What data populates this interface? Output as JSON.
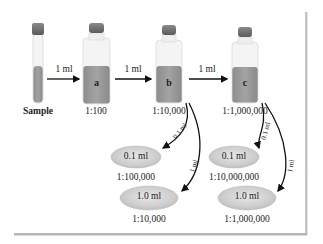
{
  "diagram": {
    "sample_label": "Sample",
    "transfer_volume": "1 ml",
    "bottles": [
      {
        "letter": "a",
        "dilution": "1:100"
      },
      {
        "letter": "b",
        "dilution": "1:10,000"
      },
      {
        "letter": "c",
        "dilution": "1:1,000,000"
      }
    ],
    "branches": [
      {
        "from": "b",
        "small_volume": "0.1 ml",
        "large_volume": "1 ml"
      },
      {
        "from": "c",
        "small_volume": "0.1 ml",
        "large_volume": "1 ml"
      }
    ],
    "plates": [
      {
        "volume": "0.1 ml",
        "dilution": "1:100,000"
      },
      {
        "volume": "1.0 ml",
        "dilution": "1:10,000"
      },
      {
        "volume": "0.1 ml",
        "dilution": "1:10,000,000"
      },
      {
        "volume": "1.0 ml",
        "dilution": "1:1,000,000"
      }
    ],
    "colors": {
      "liquid": "#9a9a9a",
      "cap": "#6f6f6f",
      "glass": "#f2f2f2",
      "plate": "#cfcfcf",
      "arrow": "#111111",
      "frame_shadow": "#b5b5b5"
    }
  }
}
